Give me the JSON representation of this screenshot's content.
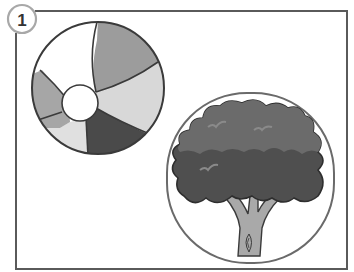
{
  "badge": {
    "number": "1"
  },
  "items": [
    {
      "id": "beach-ball",
      "label": "beach ball"
    },
    {
      "id": "tree",
      "label": "tree"
    }
  ],
  "colors": {
    "frame": "#5a5a5a",
    "badge_border": "#a8a8a8",
    "ball_outline": "#3a3a3a",
    "ball_white": "#ffffff",
    "ball_mid_gray": "#9c9c9c",
    "ball_light_gray": "#d2d2d2",
    "ball_dark_gray": "#4a4a4a",
    "ball_pale": "#e2e2e2",
    "tree_frame": "#6a6a6a",
    "foliage_top": "#6b6b6b",
    "foliage_bottom": "#4f4f4f",
    "foliage_highlight": "#8a8a8a",
    "trunk": "#a9a9a9",
    "trunk_outline": "#3a3a3a"
  }
}
